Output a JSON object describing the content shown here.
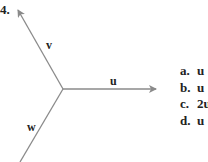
{
  "question": {
    "number": "4.",
    "vectors": [
      {
        "name": "v",
        "label": "v"
      },
      {
        "name": "u",
        "label": "u"
      },
      {
        "name": "w",
        "label": "w"
      }
    ],
    "options": [
      {
        "letter": "a.",
        "text": "u"
      },
      {
        "letter": "b.",
        "text": "u"
      },
      {
        "letter": "c.",
        "text": "2u"
      },
      {
        "letter": "d.",
        "text": "u"
      }
    ]
  },
  "colors": {
    "arrow": "#8a8a8a",
    "text": "#222222"
  }
}
